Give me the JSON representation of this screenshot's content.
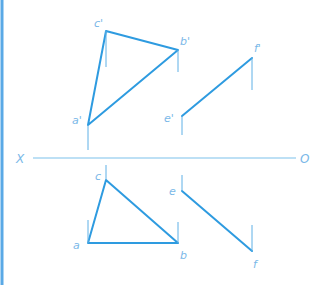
{
  "diagram": {
    "axis": {
      "left_label": "X",
      "right_label": "O"
    },
    "colors": {
      "line": "#2e9be0",
      "label": "#7ab8e8",
      "axis": "#7cc2ec",
      "border": "#5aa9e6"
    },
    "front_view": {
      "triangle_labels": {
        "a": "a'",
        "b": "b'",
        "c": "c'"
      },
      "line_labels": {
        "e": "e'",
        "f": "f'"
      }
    },
    "top_view": {
      "triangle_labels": {
        "a": "a",
        "b": "b",
        "c": "c"
      },
      "line_labels": {
        "e": "e",
        "f": "f"
      }
    }
  }
}
